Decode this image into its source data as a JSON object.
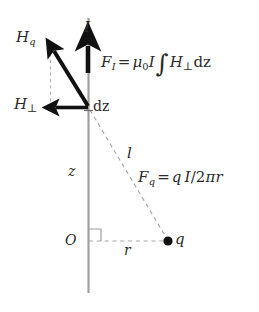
{
  "figure": {
    "background_color": "#ffffff",
    "line_color": "#2b2b2b",
    "axis_color": "#9a9a9a",
    "dashed_color": "#a8a8a8",
    "arrow_color": "#111111"
  },
  "labels": {
    "h_q": "H",
    "h_q_sub": "q",
    "h_perp": "H",
    "h_perp_sub": "⊥",
    "current": "I",
    "dz": "dz",
    "z_axis": "z",
    "length_l": "l",
    "origin": "O",
    "radius_r": "r",
    "charge_q": "q"
  },
  "formulas": {
    "force_I": {
      "lhs": "F",
      "lhs_sub": "I",
      "equals": "=",
      "mu": "μ",
      "mu_sub": "0",
      "current": "I",
      "integral": "∫",
      "field": "H",
      "field_sub": "⊥",
      "differential": "dz",
      "plain": "F_I = μ₀I ∫ H⊥ dz"
    },
    "force_q": {
      "lhs": "F",
      "lhs_sub": "q",
      "equals": "=",
      "charge": "q",
      "current": "I",
      "slash": "/",
      "two": "2",
      "pi": "π",
      "radius": "r",
      "plain": "F_q = qI/2πr"
    }
  },
  "geometry": {
    "wire_x": 88,
    "wire_top_y": 18,
    "wire_bottom_y": 293,
    "vertex_x": 88,
    "vertex_y": 107,
    "origin_y": 241,
    "charge_x": 168,
    "charge_y": 241,
    "hq_tip_x": 50,
    "hq_tip_y": 47,
    "hperp_tip_x": 50,
    "hperp_tip_y": 107,
    "current_arrow_x": 88,
    "current_arrow_base_y": 72,
    "current_arrow_tip_y": 40,
    "right_angle_size": 12
  }
}
